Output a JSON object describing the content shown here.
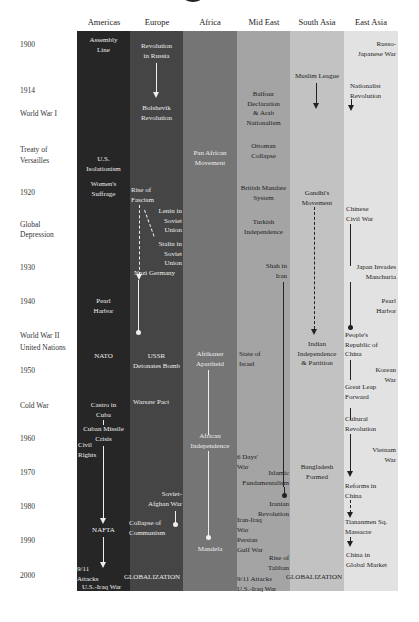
{
  "columns": [
    {
      "label": "Americas",
      "color": "#262626"
    },
    {
      "label": "Europe",
      "color": "#454545"
    },
    {
      "label": "Africa",
      "color": "#757575"
    },
    {
      "label": "Mid East",
      "color": "#a4a4a4"
    },
    {
      "label": "South Asia",
      "color": "#c2c2c2"
    },
    {
      "label": "East Asia",
      "color": "#e2e2e2"
    }
  ],
  "year_labels": [
    {
      "text": "1900"
    },
    {
      "text": "1914"
    },
    {
      "text": "World War I"
    },
    {
      "text": "Treaty of"
    },
    {
      "text": "Versailles"
    },
    {
      "text": "1920"
    },
    {
      "text": "Global"
    },
    {
      "text": "Depression"
    },
    {
      "text": "1930"
    },
    {
      "text": "1940"
    },
    {
      "text": "World War II"
    },
    {
      "text": "United Nations"
    },
    {
      "text": "1950"
    },
    {
      "text": "Cold War"
    },
    {
      "text": "1960"
    },
    {
      "text": "1970"
    },
    {
      "text": "1980"
    },
    {
      "text": "1990"
    },
    {
      "text": "2000"
    }
  ],
  "events": {
    "americas": [
      "Assembly",
      "Line",
      "U.S.",
      "Isolationism",
      "Women's",
      "Suffrage",
      "Pearl",
      "Harbor",
      "NATO",
      "Castro in",
      "Cuba",
      "Cuban Missile",
      "Crisis",
      "Civil",
      "Rights",
      "NAFTA",
      "9/11",
      "Attacks",
      "U.S.-Iraq War"
    ],
    "europe": [
      "Revolution",
      "in Russia",
      "Bolshevik",
      "Revolution",
      "Rise of",
      "Fascism",
      "Lenin in",
      "Soviet",
      "Union",
      "Stalin in",
      "Soviet",
      "Union",
      "Nazi Germany",
      "USSR",
      "Detonates Bomb",
      "Warsaw Pact",
      "Soviet-",
      "Afghan War",
      "Collapse of",
      "Communism",
      "GLOBALIZATION"
    ],
    "africa": [
      "Pan African",
      "Movement",
      "Afrikaner",
      "Apartheid",
      "African",
      "Independence",
      "Mandela"
    ],
    "mideast": [
      "Balfour",
      "Declaration",
      "& Arab",
      "Nationalism",
      "Ottoman",
      "Collapse",
      "British Mandate",
      "System",
      "Turkish",
      "Independence",
      "Shah in",
      "Iran",
      "State of",
      "Israel",
      "6 Days'",
      "War",
      "Islamic",
      "Fundamentalism",
      "Iranian",
      "Revolution",
      "Iran-Iraq",
      "War",
      "Persian",
      "Gulf War",
      "Rise of",
      "Taliban",
      "9/11 Attacks",
      "U.S.-Iraq War"
    ],
    "southasia": [
      "Muslim League",
      "Gandhi's",
      "Movement",
      "Indian",
      "Independence",
      "& Partition",
      "Bangladesh",
      "Formed",
      "GLOBALIZATION"
    ],
    "eastasia": [
      "Russo-",
      "Japanese War",
      "Nationalist",
      "Revolution",
      "Chinese",
      "Civil War",
      "Japan Invades",
      "Manchuria",
      "Pearl",
      "Harbor",
      "People's",
      "Republic of",
      "China",
      "Korean",
      "War",
      "Great Leap",
      "Forward",
      "Cultural",
      "Revolution",
      "Vietnam",
      "War",
      "Reforms in",
      "China",
      "Tiananmen Sq.",
      "Massacre",
      "China in",
      "Global Market"
    ]
  }
}
